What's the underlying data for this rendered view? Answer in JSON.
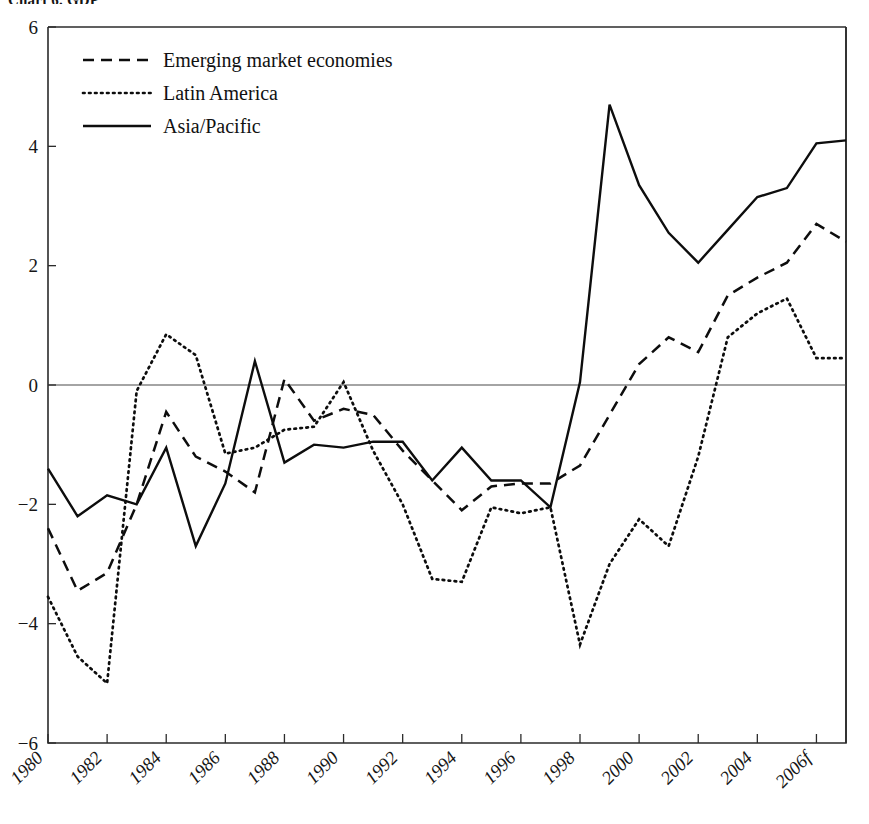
{
  "title": "Chart 6. GDP",
  "legend": {
    "position": "top-left-inside",
    "items": [
      {
        "label": "Emerging market economies",
        "style": "dashed",
        "name": "emerging"
      },
      {
        "label": "Latin America",
        "style": "dotted",
        "name": "latin"
      },
      {
        "label": "Asia/Pacific",
        "style": "solid",
        "name": "asia"
      }
    ]
  },
  "axes": {
    "y_ticks": [
      "6",
      "4",
      "2",
      "0",
      "-2",
      "-4",
      "-6"
    ],
    "x_ticks": [
      "1980",
      "1982",
      "1984",
      "1986",
      "1988",
      "1990",
      "1992",
      "1994",
      "1996",
      "1998",
      "2000",
      "2002",
      "2004",
      "2006f"
    ],
    "ylabel": "",
    "xlabel": ""
  },
  "chart_data": {
    "type": "line",
    "title": "Chart 6. GDP",
    "xlabel": "",
    "ylabel": "",
    "ylim": [
      -6,
      6
    ],
    "xlim": [
      1980,
      2007
    ],
    "grid": false,
    "zero_line": true,
    "legend_position": "upper left",
    "x": [
      1980,
      1981,
      1982,
      1983,
      1984,
      1985,
      1986,
      1987,
      1988,
      1989,
      1990,
      1991,
      1992,
      1993,
      1994,
      1995,
      1996,
      1997,
      1998,
      1999,
      2000,
      2001,
      2002,
      2003,
      2004,
      2005,
      2006,
      2007
    ],
    "x_tick_labels": [
      "1980",
      "",
      "1982",
      "",
      "1984",
      "",
      "1986",
      "",
      "1988",
      "",
      "1990",
      "",
      "1992",
      "",
      "1994",
      "",
      "1996",
      "",
      "1998",
      "",
      "2000",
      "",
      "2002",
      "",
      "2004",
      "",
      "2006f",
      ""
    ],
    "series": [
      {
        "name": "Emerging market economies",
        "style": "dashed",
        "values": [
          -2.4,
          -3.45,
          -3.15,
          -2.0,
          -0.45,
          -1.2,
          -1.45,
          -1.8,
          0.1,
          -0.6,
          -0.4,
          -0.5,
          -1.1,
          -1.6,
          -2.1,
          -1.7,
          -1.65,
          -1.65,
          -1.35,
          -0.5,
          0.35,
          0.8,
          0.55,
          1.5,
          1.8,
          2.05,
          2.7,
          2.4
        ]
      },
      {
        "name": "Latin America",
        "style": "dotted",
        "values": [
          -3.55,
          -4.55,
          -5.0,
          -0.1,
          0.85,
          0.5,
          -1.15,
          -1.05,
          -0.75,
          -0.7,
          0.05,
          -1.1,
          -2.0,
          -3.25,
          -3.3,
          -2.05,
          -2.15,
          -2.05,
          -4.35,
          -3.0,
          -2.25,
          -2.7,
          -1.2,
          0.8,
          1.2,
          1.45,
          0.45,
          0.45
        ]
      },
      {
        "name": "Asia/Pacific",
        "style": "solid",
        "values": [
          -1.4,
          -2.2,
          -1.85,
          -2.0,
          -1.05,
          -2.7,
          -1.65,
          0.4,
          -1.3,
          -1.0,
          -1.05,
          -0.95,
          -0.95,
          -1.6,
          -1.05,
          -1.6,
          -1.6,
          -2.05,
          0.05,
          4.7,
          3.35,
          2.55,
          2.05,
          2.6,
          3.15,
          3.3,
          4.05,
          4.1
        ]
      }
    ]
  }
}
